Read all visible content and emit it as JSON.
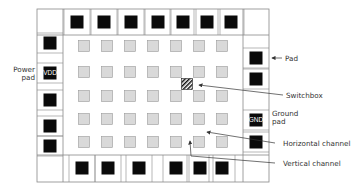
{
  "diagram": {
    "type": "fpga-floorplan",
    "grid": {
      "columns": 7,
      "rows": 5,
      "col_x": [
        84,
        107,
        130,
        153,
        176,
        199,
        222
      ],
      "row_y": [
        46,
        72,
        96,
        119,
        142
      ]
    },
    "switchbox": {
      "x": 187,
      "y": 84
    },
    "pads": {
      "top": [
        77,
        104,
        131,
        158,
        183,
        207,
        231
      ],
      "bottom": [
        82,
        108,
        139,
        176,
        200,
        222
      ],
      "left": [
        {
          "y": 43,
          "label": ""
        },
        {
          "y": 73,
          "label": "VDD"
        },
        {
          "y": 100,
          "label": ""
        },
        {
          "y": 126,
          "label": ""
        },
        {
          "y": 146,
          "label": ""
        }
      ],
      "right": [
        {
          "y": 58,
          "label": ""
        },
        {
          "y": 79,
          "label": ""
        },
        {
          "y": 120,
          "label": "GND"
        },
        {
          "y": 142,
          "label": ""
        }
      ]
    },
    "colors": {
      "frame": "#888888",
      "pad": "#0a0a0a",
      "logic_block_fill": "#d9d9d9",
      "logic_block_stroke": "#999999",
      "label_text": "#333333",
      "arrow": "#333333"
    }
  },
  "labels": {
    "power_pad": [
      "Power",
      "pad"
    ],
    "vdd": "VDD",
    "gnd": "GND",
    "pad": "Pad",
    "switchbox": "Switchbox",
    "ground_pad": [
      "Ground",
      "pad"
    ],
    "horizontal_channel": "Horizontal channel",
    "vertical_channel": "Vertical channel"
  }
}
